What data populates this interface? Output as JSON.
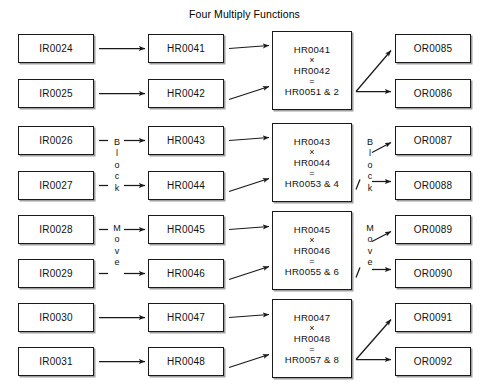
{
  "title": "Four Multiply Functions",
  "columns": {
    "inputs_label": "IR",
    "holding_label": "HR",
    "outputs_label": "OR"
  },
  "rows": [
    {
      "input": "IR0024",
      "holding": "HR0041",
      "output": "OR0085"
    },
    {
      "input": "IR0025",
      "holding": "HR0042",
      "output": "OR0086"
    },
    {
      "input": "IR0026",
      "holding": "HR0043",
      "output": "OR0087"
    },
    {
      "input": "IR0027",
      "holding": "HR0044",
      "output": "OR0088"
    },
    {
      "input": "IR0028",
      "holding": "HR0045",
      "output": "OR0089"
    },
    {
      "input": "IR0029",
      "holding": "HR0046",
      "output": "OR0090"
    },
    {
      "input": "IR0030",
      "holding": "HR0047",
      "output": "OR0091"
    },
    {
      "input": "IR0031",
      "holding": "HR0048",
      "output": "OR0092"
    }
  ],
  "multiply_blocks": [
    {
      "operand_a": "HR0041",
      "operator": "×",
      "operand_b": "HR0042",
      "equals": "=",
      "result": "HR0051 & 2"
    },
    {
      "operand_a": "HR0043",
      "operator": "×",
      "operand_b": "HR0044",
      "equals": "=",
      "result": "HR0053 & 4"
    },
    {
      "operand_a": "HR0045",
      "operator": "×",
      "operand_b": "HR0046",
      "equals": "=",
      "result": "HR0055 & 6"
    },
    {
      "operand_a": "HR0047",
      "operator": "×",
      "operand_b": "HR0048",
      "equals": "=",
      "result": "HR0057 & 8"
    }
  ],
  "vertical_labels": {
    "block": {
      "l0": "B",
      "l1": "l",
      "l2": "o",
      "l3": "c",
      "l4": "k"
    },
    "move": {
      "l0": "M",
      "l1": "o",
      "l2": "v",
      "l3": "e"
    }
  },
  "colors": {
    "stroke": "#1a1a1a",
    "text": "#111111",
    "background": "#ffffff"
  }
}
